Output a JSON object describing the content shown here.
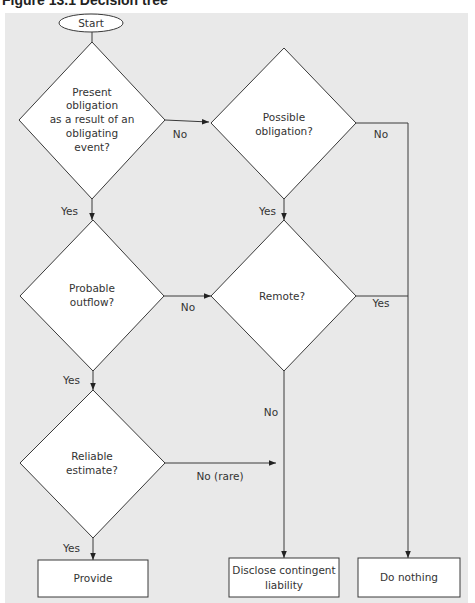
{
  "figure": {
    "title": "Figure 13.1  Decision tree"
  },
  "nodes": {
    "start": {
      "label": "Start"
    },
    "present_obligation": {
      "lines": [
        "Present",
        "obligation",
        "as a result of an",
        "obligating",
        "event?"
      ]
    },
    "possible_obligation": {
      "lines": [
        "Possible",
        "obligation?"
      ]
    },
    "probable_outflow": {
      "lines": [
        "Probable",
        "outflow?"
      ]
    },
    "remote": {
      "lines": [
        "Remote?"
      ]
    },
    "reliable_estimate": {
      "lines": [
        "Reliable",
        "estimate?"
      ]
    },
    "provide": {
      "label": "Provide"
    },
    "disclose": {
      "lines": [
        "Disclose contingent",
        "liability"
      ]
    },
    "do_nothing": {
      "label": "Do nothing"
    }
  },
  "edges": {
    "present_no": "No",
    "present_yes": "Yes",
    "possible_no": "No",
    "possible_yes": "Yes",
    "probable_no": "No",
    "probable_yes": "Yes",
    "remote_yes": "Yes",
    "remote_no": "No",
    "reliable_no": "No (rare)",
    "reliable_yes": "Yes"
  },
  "colors": {
    "panel_background": "#e9e9e9",
    "shape_fill": "#ffffff",
    "stroke": "#3a3a3a",
    "text": "#333333"
  }
}
